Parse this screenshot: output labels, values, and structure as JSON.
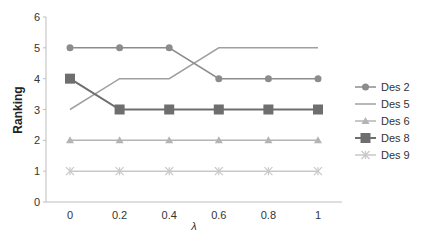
{
  "chart_data": {
    "type": "line",
    "title": "",
    "xlabel": "λ",
    "ylabel": "Ranking",
    "x": [
      0,
      0.2,
      0.4,
      0.6,
      0.8,
      1
    ],
    "x_tick_labels": [
      "0",
      "0.2",
      "0.4",
      "0.6",
      "0.8",
      "1"
    ],
    "y_tick_labels": [
      "0",
      "1",
      "2",
      "3",
      "4",
      "5",
      "6"
    ],
    "ylim": [
      0,
      6
    ],
    "grid": false,
    "legend_position": "right",
    "series": [
      {
        "name": "Des 2",
        "values": [
          5,
          5,
          5,
          4,
          4,
          4
        ],
        "marker": "circle",
        "color": "#8c8c8c"
      },
      {
        "name": "Des 5",
        "values": [
          3,
          4,
          4,
          5,
          5,
          5
        ],
        "marker": "none",
        "color": "#a0a0a0"
      },
      {
        "name": "Des 6",
        "values": [
          2,
          2,
          2,
          2,
          2,
          2
        ],
        "marker": "triangle",
        "color": "#b4b4b4"
      },
      {
        "name": "Des 8",
        "values": [
          4,
          3,
          3,
          3,
          3,
          3
        ],
        "marker": "square",
        "color": "#6e6e6e"
      },
      {
        "name": "Des 9",
        "values": [
          1,
          1,
          1,
          1,
          1,
          1
        ],
        "marker": "asterisk",
        "color": "#c8c8c8"
      }
    ]
  }
}
